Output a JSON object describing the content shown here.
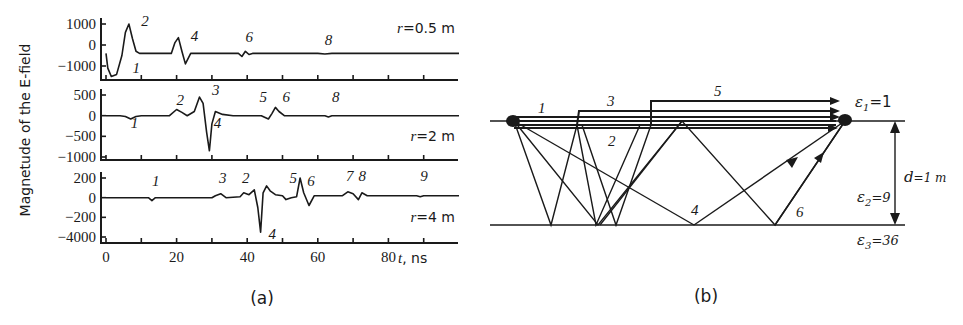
{
  "figure": {
    "panel_a_caption": "(a)",
    "panel_b_caption": "(b)"
  },
  "chart_data": [
    {
      "type": "line",
      "panel": "a",
      "title": "",
      "ylabel": "Magnetude of the E-field",
      "xlabel": "t, ns",
      "xlabel_var": "t",
      "xlabel_unit": ", ns",
      "x_ticks": [
        0,
        20,
        40,
        60,
        80
      ],
      "xlim": [
        0,
        100
      ],
      "grid": false,
      "subplots": [
        {
          "label": "r=0.5 m",
          "label_var": "r",
          "label_val": "=0.5 m",
          "ylim": [
            -1600,
            1400
          ],
          "y_ticks": [
            1000,
            0,
            -1000
          ],
          "y_tick_labels": [
            "1000",
            "0",
            "−1000"
          ],
          "x": [
            0,
            0.5,
            1.5,
            3,
            4.5,
            5.5,
            6.5,
            7.5,
            8.5,
            9.5,
            10.5,
            11.5,
            13,
            16,
            18.5,
            19.5,
            20.5,
            21.5,
            22.5,
            24,
            30,
            37.5,
            38.5,
            39.5,
            40.5,
            41.5,
            60,
            62,
            64,
            80,
            100
          ],
          "values": [
            -400,
            -1100,
            -1500,
            -1400,
            -500,
            600,
            1000,
            300,
            -300,
            -400,
            -400,
            -400,
            -400,
            -400,
            -400,
            100,
            350,
            -300,
            -900,
            -400,
            -400,
            -400,
            -550,
            -300,
            -450,
            -400,
            -400,
            -430,
            -400,
            -400,
            -400
          ],
          "peaks": [
            {
              "id": "1",
              "t": 7.5,
              "val": -1350
            },
            {
              "id": "2",
              "t": 10,
              "val": 900
            },
            {
              "id": "4",
              "t": 24,
              "val": 200
            },
            {
              "id": "6",
              "t": 39.5,
              "val": 120
            },
            {
              "id": "8",
              "t": 62,
              "val": 20
            }
          ]
        },
        {
          "label": "r=2 m",
          "label_var": "r",
          "label_val": "=2 m",
          "ylim": [
            -1060,
            700
          ],
          "y_ticks": [
            500,
            0,
            -500,
            -1000
          ],
          "y_tick_labels": [
            "500",
            "0",
            "−500",
            "−1000"
          ],
          "x": [
            0,
            4,
            5.5,
            7,
            8.5,
            10,
            18,
            20,
            21.5,
            23,
            25,
            26.5,
            27.5,
            28.5,
            29.3,
            30,
            31,
            33,
            36,
            44,
            46,
            47,
            48,
            49,
            50.5,
            52,
            62,
            63,
            64,
            100
          ],
          "values": [
            0,
            0,
            -20,
            -80,
            -20,
            0,
            0,
            150,
            80,
            0,
            100,
            450,
            300,
            -400,
            -850,
            -200,
            100,
            30,
            0,
            0,
            -80,
            50,
            200,
            100,
            0,
            0,
            0,
            -30,
            0,
            0
          ],
          "peaks": [
            {
              "id": "1",
              "t": 7,
              "val": -300
            },
            {
              "id": "2",
              "t": 20,
              "val": 270
            },
            {
              "id": "3",
              "t": 30,
              "val": 500
            },
            {
              "id": "4",
              "t": 30.5,
              "val": -300
            },
            {
              "id": "5",
              "t": 43.5,
              "val": 320
            },
            {
              "id": "6",
              "t": 50,
              "val": 320
            },
            {
              "id": "8",
              "t": 64,
              "val": 320
            }
          ]
        },
        {
          "label": "r=4 m",
          "label_var": "r",
          "label_val": "=4 m",
          "ylim": [
            -460,
            260
          ],
          "y_ticks": [
            200,
            0,
            -200,
            -400
          ],
          "y_tick_labels": [
            "200",
            "0",
            "−200",
            "−4000"
          ],
          "x": [
            0,
            12,
            13,
            14,
            16,
            30,
            31,
            32.5,
            34,
            38,
            39,
            40.5,
            42,
            43,
            43.8,
            44.5,
            45.5,
            46.5,
            48,
            50,
            51,
            52.5,
            54,
            55,
            56,
            57.5,
            59,
            67,
            68.5,
            70,
            71.5,
            72.5,
            74,
            88,
            89,
            90,
            100
          ],
          "values": [
            0,
            0,
            -30,
            0,
            0,
            0,
            20,
            40,
            0,
            10,
            50,
            30,
            80,
            -100,
            -350,
            50,
            120,
            70,
            30,
            20,
            -20,
            0,
            10,
            200,
            50,
            -80,
            20,
            20,
            60,
            40,
            -20,
            50,
            20,
            20,
            10,
            20,
            20
          ],
          "peaks": [
            {
              "id": "1",
              "t": 13,
              "val": 120
            },
            {
              "id": "3",
              "t": 32,
              "val": 150
            },
            {
              "id": "2",
              "t": 38.5,
              "val": 150
            },
            {
              "id": "4",
              "t": 46,
              "val": -420
            },
            {
              "id": "5",
              "t": 52,
              "val": 150
            },
            {
              "id": "6",
              "t": 57,
              "val": 120
            },
            {
              "id": "7",
              "t": 68,
              "val": 170
            },
            {
              "id": "8",
              "t": 71.5,
              "val": 170
            },
            {
              "id": "9",
              "t": 89,
              "val": 170
            }
          ]
        }
      ]
    },
    {
      "type": "diagram",
      "panel": "b",
      "title": "Ray paths in a two-layer medium",
      "layers": [
        {
          "name": "air",
          "label": "ε₁=1",
          "eps_sub": "1",
          "eps_val": "=1"
        },
        {
          "name": "layer",
          "label": "ε₂=9",
          "eps_sub": "2",
          "eps_val": "=9"
        },
        {
          "name": "substrate",
          "label": "ε₃=36",
          "eps_sub": "3",
          "eps_val": "=36"
        }
      ],
      "thickness_label": "d=1 m",
      "thickness_var": "d",
      "thickness_val": "=1 m",
      "ray_labels": [
        "1",
        "2",
        "3",
        "4",
        "5",
        "6"
      ]
    }
  ]
}
